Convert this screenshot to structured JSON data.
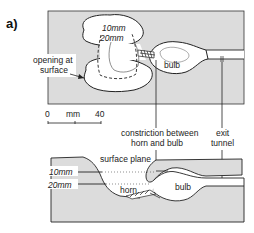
{
  "figure": {
    "panel_label": "a)",
    "plan_view": {
      "labels": {
        "opening": [
          "opening at",
          "surface"
        ],
        "depth_10": "10mm",
        "depth_20": "20mm",
        "bulb": "bulb"
      },
      "scale_bar": {
        "start": "0",
        "unit": "mm",
        "end": "40"
      }
    },
    "callouts": {
      "constriction": [
        "constriction between",
        "horn and bulb"
      ],
      "exit": [
        "exit",
        "tunnel"
      ]
    },
    "section_view": {
      "labels": {
        "surface_plane": "surface plane",
        "depth_10": "10mm",
        "depth_20": "20mm",
        "horn": "horn",
        "bulb": "bulb"
      }
    },
    "colors": {
      "fill": "#dcdcdc",
      "line": "#222222",
      "background": "#ffffff"
    }
  }
}
